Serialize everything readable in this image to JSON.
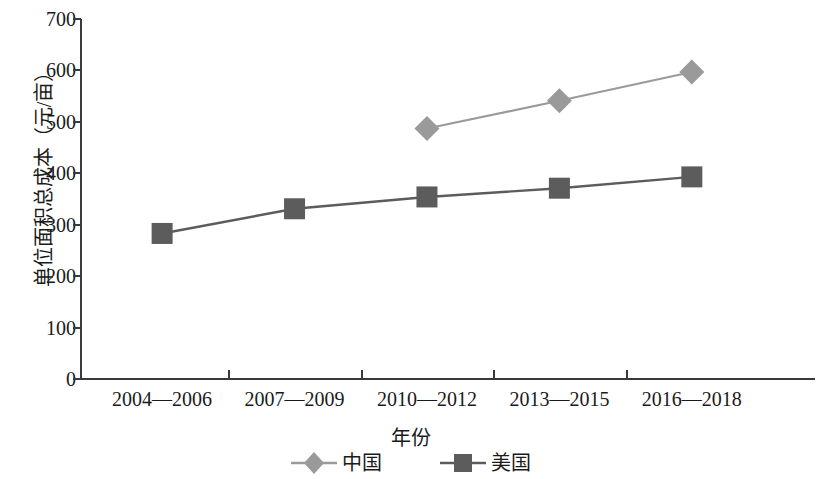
{
  "chart_data": {
    "type": "line",
    "title": "",
    "xlabel": "年份",
    "ylabel": "单位面积总成本（元/亩）",
    "categories": [
      "2004—2006",
      "2007—2009",
      "2010—2012",
      "2013—2015",
      "2016—2018"
    ],
    "series": [
      {
        "name": "中国",
        "marker": "diamond",
        "color": "#9a9a9a",
        "values": [
          null,
          null,
          487,
          541,
          597
        ]
      },
      {
        "name": "美国",
        "marker": "square",
        "color": "#5c5c5c",
        "values": [
          283,
          331,
          354,
          371,
          393
        ]
      }
    ],
    "ylim": [
      0,
      700
    ],
    "y_ticks": [
      0,
      100,
      200,
      300,
      400,
      500,
      600,
      700
    ],
    "y_tick_labels": [
      "0",
      "100",
      "200",
      "300",
      "400",
      "500",
      "600",
      "700"
    ],
    "grid": false,
    "legend_position": "bottom",
    "legend_entries": [
      "中国",
      "美国"
    ],
    "axis_color": "#3a3a3a"
  }
}
